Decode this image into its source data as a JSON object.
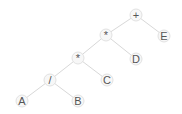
{
  "diagram": {
    "nodes": [
      {
        "id": "plus",
        "label": "+",
        "x": 136,
        "y": 15
      },
      {
        "id": "mul1",
        "label": "*",
        "x": 106,
        "y": 35
      },
      {
        "id": "E",
        "label": "E",
        "x": 164,
        "y": 36
      },
      {
        "id": "mul2",
        "label": "*",
        "x": 78,
        "y": 58
      },
      {
        "id": "D",
        "label": "D",
        "x": 136,
        "y": 59
      },
      {
        "id": "div",
        "label": "/",
        "x": 50,
        "y": 80
      },
      {
        "id": "C",
        "label": "C",
        "x": 107,
        "y": 80
      },
      {
        "id": "A",
        "label": "A",
        "x": 22,
        "y": 101
      },
      {
        "id": "B",
        "label": "B",
        "x": 78,
        "y": 101
      }
    ],
    "edges": [
      [
        "plus",
        "mul1"
      ],
      [
        "plus",
        "E"
      ],
      [
        "mul1",
        "mul2"
      ],
      [
        "mul1",
        "D"
      ],
      [
        "mul2",
        "div"
      ],
      [
        "mul2",
        "C"
      ],
      [
        "div",
        "A"
      ],
      [
        "div",
        "B"
      ]
    ],
    "colors": {
      "edge": "#d8d8d8",
      "node_fill": "#f7f7f7",
      "node_stroke": "#e2e2e2",
      "text": "#555555"
    }
  }
}
